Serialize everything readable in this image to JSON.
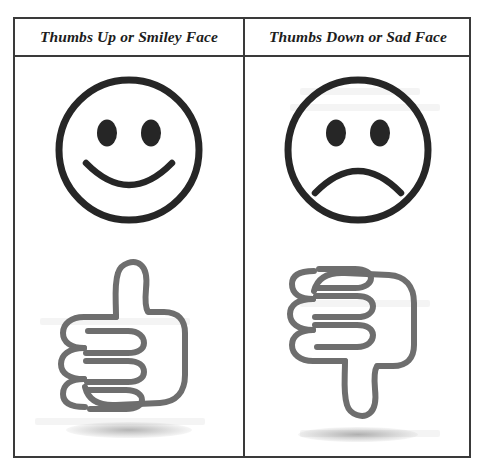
{
  "page": {
    "background_color": "#ffffff",
    "border_color": "#3a3a3a",
    "face_stroke_color": "#262626",
    "thumb_stroke_color": "#6e6e6e"
  },
  "table": {
    "columns": [
      {
        "header": "Thumbs Up or Smiley Face",
        "sentiment": "positive",
        "figures": [
          {
            "icon": "smiley-face-icon",
            "label": "Smiley Face"
          },
          {
            "icon": "thumbs-up-icon",
            "label": "Thumbs Up"
          }
        ]
      },
      {
        "header": "Thumbs Down or Sad Face",
        "sentiment": "negative",
        "figures": [
          {
            "icon": "sad-face-icon",
            "label": "Sad Face"
          },
          {
            "icon": "thumbs-down-icon",
            "label": "Thumbs Down"
          }
        ]
      }
    ]
  }
}
